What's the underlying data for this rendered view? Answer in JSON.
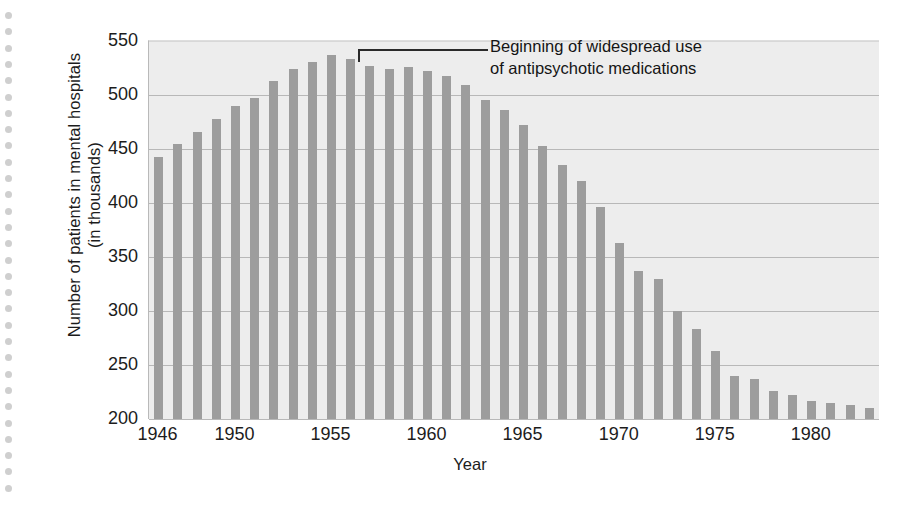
{
  "chart_data": {
    "type": "bar",
    "title": "",
    "xlabel": "Year",
    "ylabel": "Number of patients in mental hospitals (in thousands)",
    "ylabel_line1": "Number of patients in mental hospitals",
    "ylabel_line2": "(in thousands)",
    "ylim": [
      200,
      550
    ],
    "ytick_values": [
      550,
      500,
      450,
      400,
      350,
      300,
      250,
      200
    ],
    "ytick_labels": [
      "550",
      "500",
      "450",
      "400",
      "350",
      "300",
      "250",
      "200"
    ],
    "xtick_labels": [
      "1946",
      "1950",
      "1955",
      "1960",
      "1965",
      "1970",
      "1975",
      "1980"
    ],
    "xtick_years": [
      1946,
      1950,
      1955,
      1960,
      1965,
      1970,
      1975,
      1980
    ],
    "xlim": [
      1946,
      1983
    ],
    "grid": "horizontal",
    "legend": "none",
    "bar_color": "#9d9d9d",
    "plot_background": "#ededed",
    "gridline_color": "#b8b8b8",
    "categories": [
      1946,
      1947,
      1948,
      1949,
      1950,
      1951,
      1952,
      1953,
      1954,
      1955,
      1956,
      1957,
      1958,
      1959,
      1960,
      1961,
      1962,
      1963,
      1964,
      1965,
      1966,
      1967,
      1968,
      1969,
      1970,
      1971,
      1972,
      1973,
      1974,
      1975,
      1976,
      1977,
      1978,
      1979,
      1980,
      1981,
      1982,
      1983
    ],
    "values": [
      443,
      455,
      466,
      478,
      490,
      497,
      513,
      524,
      531,
      537,
      533,
      527,
      524,
      526,
      522,
      518,
      509,
      495,
      486,
      472,
      453,
      435,
      420,
      396,
      363,
      337,
      330,
      300,
      283,
      263,
      240,
      237,
      226,
      222,
      217,
      215,
      213,
      210
    ],
    "annotations": [
      {
        "text_line1": "Beginning of widespread use",
        "text_line2": "of antipsychotic medications",
        "points_to_year": 1956
      }
    ]
  }
}
